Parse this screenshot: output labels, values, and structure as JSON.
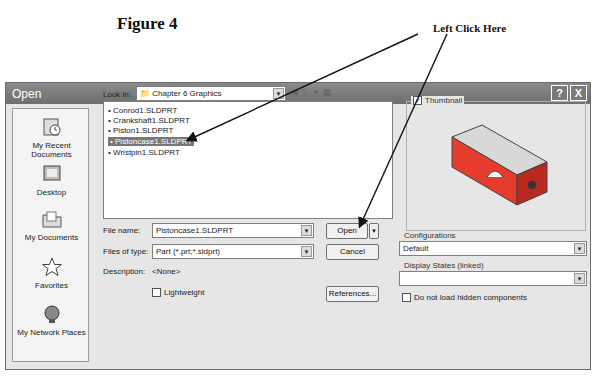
{
  "figure": {
    "title": "Figure 4",
    "callout": "Left Click Here"
  },
  "dialog": {
    "title": "Open",
    "help_label": "?",
    "close_label": "X",
    "places": [
      {
        "label": "My Recent Documents"
      },
      {
        "label": "Desktop"
      },
      {
        "label": "My Documents"
      },
      {
        "label": "Favorites"
      },
      {
        "label": "My Network Places"
      }
    ],
    "look_in_label": "Look in:",
    "look_in_value": "Chapter 6 Graphics",
    "files": [
      {
        "name": "Conrod1.SLDPRT",
        "selected": false
      },
      {
        "name": "Crankshaft1.SLDPRT",
        "selected": false
      },
      {
        "name": "Piston1.SLDPRT",
        "selected": false
      },
      {
        "name": "Pistoncase1.SLDPRT",
        "selected": true
      },
      {
        "name": "Wristpin1.SLDPRT",
        "selected": false
      }
    ],
    "file_name_label": "File name:",
    "file_name_value": "Pistoncase1.SLDPRT",
    "files_of_type_label": "Files of type:",
    "files_of_type_value": "Part (*.prt;*.sldprt)",
    "description_label": "Description:",
    "description_value": "<None>",
    "lightweight_label": "Lightweight",
    "open_button": "Open",
    "cancel_button": "Cancel",
    "references_button": "References...",
    "thumbnail_label": "Thumbnail",
    "configurations_label": "Configurations",
    "configurations_value": "Default",
    "display_states_label": "Display States (linked)",
    "display_states_value": "",
    "hidden_components_label": "Do not load hidden components"
  }
}
